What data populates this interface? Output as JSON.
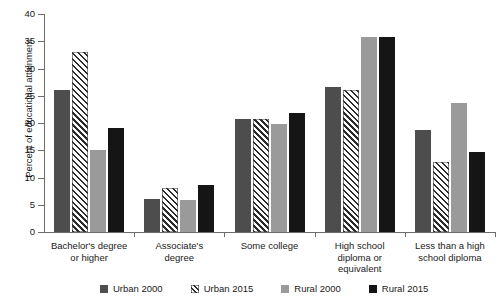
{
  "chart_data": {
    "type": "bar",
    "title": "",
    "xlabel": "",
    "ylabel": "Percent of educational attainment",
    "ylim": [
      0,
      40
    ],
    "yticks": [
      0,
      5,
      10,
      15,
      20,
      25,
      30,
      35,
      40
    ],
    "grid": false,
    "legend_position": "bottom",
    "categories": [
      "Bachelor's degree\nor higher",
      "Associate's\ndegree",
      "Some college",
      "High school\ndiploma or\nequivalent",
      "Less than a high\nschool diploma"
    ],
    "category_lines": [
      [
        "Bachelor's degree",
        "or higher"
      ],
      [
        "Associate's",
        "degree"
      ],
      [
        "Some college"
      ],
      [
        "High school",
        "diploma or",
        "equivalent"
      ],
      [
        "Less than a high",
        "school diploma"
      ]
    ],
    "series": [
      {
        "name": "Urban 2000",
        "fill": "solid-dark-gray",
        "color": "#4d4d4d",
        "values": [
          26.0,
          6.0,
          20.8,
          26.7,
          18.7
        ]
      },
      {
        "name": "Urban 2015",
        "fill": "diagonal-hatch",
        "color": "#ffffff",
        "values": [
          33.0,
          8.0,
          20.8,
          26.0,
          12.8
        ]
      },
      {
        "name": "Rural 2000",
        "fill": "solid-light-gray",
        "color": "#9a9a9a",
        "values": [
          15.0,
          5.8,
          19.8,
          35.7,
          23.7
        ]
      },
      {
        "name": "Rural 2015",
        "fill": "solid-black",
        "color": "#151515",
        "values": [
          19.0,
          8.7,
          21.8,
          35.7,
          14.6
        ]
      }
    ]
  },
  "axis": {
    "color": "#6d6d6d"
  }
}
